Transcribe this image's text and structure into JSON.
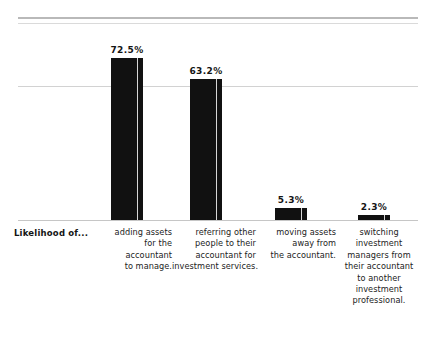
{
  "chart_data": {
    "type": "bar",
    "title": "",
    "subtitle": "",
    "xlabel": "",
    "ylabel": "",
    "row_title": "Likelihood of...",
    "categories": [
      "adding assets for the accountant to manage.",
      "referring other people to their accountant for investment services.",
      "moving assets away from the accountant.",
      "switching investment managers from their accountant to another investment professional."
    ],
    "category_lines": [
      [
        "adding assets",
        "for the",
        "accountant",
        "to manage."
      ],
      [
        "referring other",
        "people to their",
        "accountant for",
        "investment services."
      ],
      [
        "moving assets",
        "away from",
        "the accountant."
      ],
      [
        "switching",
        "investment",
        "managers from",
        "their accountant",
        "to another",
        "investment",
        "professional."
      ]
    ],
    "values": [
      72.5,
      63.2,
      5.3,
      2.3
    ],
    "value_labels": [
      "72.5%",
      "63.2%",
      "5.3%",
      "2.3%"
    ],
    "ylim": [
      0,
      85
    ],
    "grid": true,
    "gridlines": [
      60
    ],
    "legend": "none",
    "bar_color": "#111111",
    "bar_highlight_color": "#e8e8e8",
    "gridline_color": "#d2d2d2",
    "baseline_color": "#c6c6c6",
    "rule_color": "#b9b9b9",
    "text_color": "#232323"
  },
  "bars": [
    {
      "value_label": "72.5%",
      "category_index": 0
    },
    {
      "value_label": "63.2%",
      "category_index": 1
    },
    {
      "value_label": "5.3%",
      "category_index": 2
    },
    {
      "value_label": "2.3%",
      "category_index": 3
    }
  ],
  "labels": {
    "row_title": "Likelihood of...",
    "col0": {
      "l0": "adding assets",
      "l1": "for the",
      "l2": "accountant",
      "l3": "to manage."
    },
    "col1": {
      "l0": "referring other",
      "l1": "people to their",
      "l2": "accountant for",
      "l3": "investment services."
    },
    "col2": {
      "l0": "moving assets",
      "l1": "away from",
      "l2": "the accountant."
    },
    "col3": {
      "l0": "switching",
      "l1": "investment",
      "l2": "managers from",
      "l3": "their accountant",
      "l4": "to another",
      "l5": "investment",
      "l6": "professional."
    }
  }
}
